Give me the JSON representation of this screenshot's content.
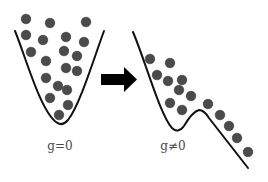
{
  "diagram": {
    "colors": {
      "ball": "#4b4b4b",
      "ball_edge": "#333333",
      "curve": "#111111",
      "arrow": "#000000",
      "label": "#4a4a4a"
    },
    "left_panel": {
      "label": "g=0",
      "label_pos": [
        60,
        139
      ],
      "curve_path": "M15,31 C25,55 40,110 56,122 Q62,127 68,120 C80,105 95,55 104,31",
      "ball_radius": 4.8,
      "balls": [
        [
          26,
          19
        ],
        [
          50,
          23
        ],
        [
          86,
          22
        ],
        [
          26,
          35
        ],
        [
          43,
          40
        ],
        [
          66,
          37
        ],
        [
          84,
          42
        ],
        [
          31,
          52
        ],
        [
          64,
          51
        ],
        [
          77,
          56
        ],
        [
          46,
          61
        ],
        [
          66,
          68
        ],
        [
          77,
          71
        ],
        [
          46,
          78
        ],
        [
          58,
          86
        ],
        [
          67,
          90
        ],
        [
          50,
          98
        ],
        [
          68,
          105
        ],
        [
          59,
          115
        ]
      ]
    },
    "right_panel": {
      "label": "g≠0",
      "label_pos": [
        173,
        139
      ],
      "curve_path": "M133,32 C145,60 160,115 172,128 Q178,134 184,126 Q192,112 199,110 Q204,110 209,118 L248,168",
      "ball_radius": 4.8,
      "balls": [
        [
          150,
          59
        ],
        [
          170,
          63
        ],
        [
          157,
          75
        ],
        [
          168,
          81
        ],
        [
          182,
          80
        ],
        [
          179,
          90
        ],
        [
          191,
          96
        ],
        [
          170,
          103
        ],
        [
          182,
          110
        ],
        [
          208,
          104
        ],
        [
          220,
          115
        ],
        [
          229,
          126
        ],
        [
          237,
          138
        ],
        [
          248,
          152
        ]
      ]
    },
    "arrow": {
      "points": "101,74 124,74 124,67 137,79.5 124,92 124,85 101,85"
    }
  }
}
